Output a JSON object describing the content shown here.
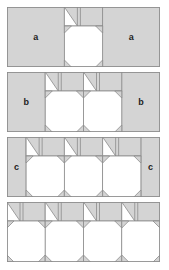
{
  "colors": {
    "fill": "#d4d4d4",
    "stroke": "#8c8c8c",
    "white": "#ffffff",
    "label": "#222222"
  },
  "panels": [
    {
      "name": "row-a",
      "top": 7,
      "blocks": 1,
      "side_label": "a"
    },
    {
      "name": "row-b",
      "top": 72,
      "blocks": 2,
      "side_label": "b"
    },
    {
      "name": "row-c",
      "top": 137,
      "blocks": 3,
      "side_label": "c"
    },
    {
      "name": "row-d",
      "top": 202,
      "blocks": 4,
      "side_label": ""
    }
  ],
  "labels": {
    "a_left": "a",
    "a_right": "a",
    "b_left": "b",
    "b_right": "b",
    "c_left": "c",
    "c_right": "c"
  }
}
